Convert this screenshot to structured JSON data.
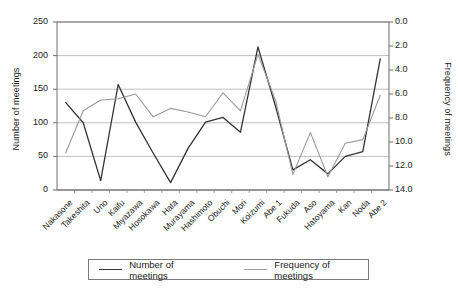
{
  "chart_data": {
    "type": "line",
    "title": "",
    "xlabel": "",
    "ylabel": "Number of meetings",
    "y2label": "Frequency of meetings",
    "grid": true,
    "legend_position": "bottom",
    "categories": [
      "Nakasone",
      "Takeshita",
      "Uno",
      "Kaifu",
      "Miyazawa",
      "Hosokawa",
      "Hata",
      "Murayama",
      "Hashimoto",
      "Obuchi",
      "Mori",
      "Koizumi",
      "Abe 1",
      "Fukuda",
      "Aso",
      "Hatoyama",
      "Kan",
      "Noda",
      "Abe 2"
    ],
    "ylim": [
      0,
      250
    ],
    "yticks": [
      "0",
      "50",
      "100",
      "150",
      "200",
      "250"
    ],
    "y2lim": [
      0,
      14
    ],
    "y2_inverted": true,
    "y2ticks": [
      "0.0",
      "2.0",
      "4.0",
      "6.0",
      "8.0",
      "10.0",
      "12.0",
      "14.0"
    ],
    "series": [
      {
        "name": "Number of meetings",
        "axis": "left",
        "color": "#333333",
        "values": [
          130,
          100,
          14,
          157,
          101,
          55,
          11,
          62,
          101,
          108,
          86,
          213,
          125,
          30,
          45,
          24,
          50,
          57,
          195
        ]
      },
      {
        "name": "Frequency of meetings",
        "axis": "right",
        "color": "#9a9a9a",
        "values": [
          10.9,
          7.4,
          6.5,
          6.4,
          6.0,
          7.9,
          7.2,
          7.5,
          7.9,
          5.9,
          7.4,
          2.7,
          6.5,
          12.7,
          9.2,
          12.9,
          10.1,
          9.8,
          6.1
        ]
      }
    ]
  },
  "legend": {
    "items": [
      {
        "label": "Number of meetings",
        "color": "#333333"
      },
      {
        "label": "Frequency of meetings",
        "color": "#9a9a9a"
      }
    ]
  }
}
